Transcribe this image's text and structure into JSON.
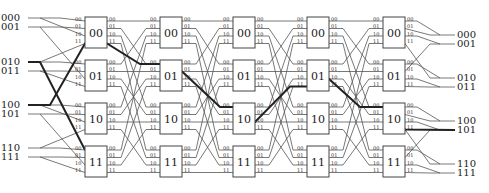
{
  "diagram": {
    "type": "benes-network",
    "inputs": [
      "000",
      "001",
      "010",
      "011",
      "100",
      "101",
      "110",
      "111"
    ],
    "outputs": [
      "000",
      "001",
      "010",
      "011",
      "100",
      "101",
      "110",
      "111"
    ],
    "columns": 5,
    "switch_labels": [
      "00",
      "01",
      "10",
      "11"
    ],
    "port_labels": [
      "00",
      "01",
      "10",
      "11"
    ],
    "colors": {
      "wire": "#555555",
      "highlight": "#222222",
      "box": "#444444"
    }
  }
}
